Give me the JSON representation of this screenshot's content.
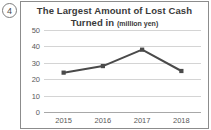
{
  "item": {
    "number": "4"
  },
  "chart_data": {
    "type": "line",
    "title": "The Largest Amount of Lost Cash Turned in",
    "title_line1": "The Largest Amount of Lost Cash",
    "title_line2": "Turned in",
    "unit_label": "(million yen)",
    "categories": [
      "2015",
      "2016",
      "2017",
      "2018"
    ],
    "values": [
      24,
      28,
      38,
      25
    ],
    "series": [
      {
        "name": "Largest amount of lost cash turned in",
        "values": [
          24,
          28,
          38,
          25
        ],
        "color": "#4a4a4a"
      }
    ],
    "xlabel": "",
    "ylabel": "",
    "ylim": [
      0,
      50
    ],
    "yticks": [
      0,
      10,
      20,
      30,
      40,
      50
    ],
    "ytick_labels": [
      "0",
      "10",
      "20",
      "30",
      "40",
      "50"
    ],
    "grid": true,
    "legend": false,
    "colors": {
      "line": "#4a4a4a",
      "marker": "#4a4a4a",
      "grid": "#d4d4d4",
      "axis": "#a8a8a8",
      "text": "#595959",
      "title": "#3a3a3a",
      "frame": "#8c8c8c"
    }
  }
}
